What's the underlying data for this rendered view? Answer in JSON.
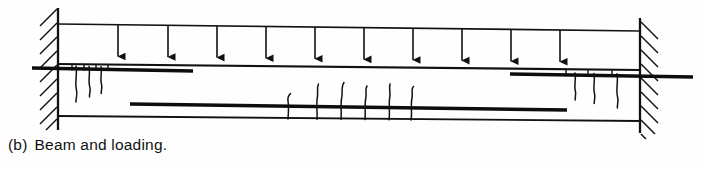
{
  "figure": {
    "caption_label": "(b)",
    "caption_text": "Beam and loading.",
    "type": "structural-beam-diagram",
    "colors": {
      "ink": "#111111",
      "background": "#fefefe",
      "rebar": "#0d0d0d"
    }
  },
  "diagram": {
    "supports": {
      "left": {
        "name": "left-fixed-support",
        "wall_x": 58,
        "hatch_direction": "up-right",
        "hatch_count": 9,
        "top_y": 10,
        "bottom_y": 128
      },
      "right": {
        "name": "right-fixed-support",
        "wall_x": 640,
        "hatch_direction": "down-right",
        "hatch_count": 9,
        "top_y": 20,
        "bottom_y": 130
      }
    },
    "beam": {
      "top_edge": {
        "x1": 58,
        "y1": 64,
        "x2": 640,
        "y2": 70
      },
      "bottom_edge": {
        "x1": 58,
        "y1": 116,
        "x2": 640,
        "y2": 121
      },
      "span_px": 582
    },
    "load": {
      "label": "uniformly distributed load",
      "load_line": {
        "x1": 58,
        "y1": 24,
        "x2": 640,
        "y2": 31
      },
      "arrow_count": 10,
      "arrow_x": [
        118,
        168,
        217,
        266,
        315,
        364,
        413,
        462,
        511,
        560
      ],
      "arrow_tail_y_left": 25,
      "arrow_head_y_left": 63
    },
    "reinforcement": [
      {
        "name": "top-left-rebar",
        "x1": 32,
        "y1": 68,
        "x2": 193,
        "y2": 71,
        "thickness": 3.4
      },
      {
        "name": "top-right-rebar",
        "x1": 510,
        "y1": 74,
        "x2": 693,
        "y2": 77,
        "thickness": 3.4
      },
      {
        "name": "bottom-midspan-rebar",
        "x1": 130,
        "y1": 104,
        "x2": 567,
        "y2": 110,
        "thickness": 3.4
      }
    ],
    "cracks": {
      "negative_moment_left": {
        "name": "left-support-cracks",
        "description": "flexural cracks at left support propagating downward from top face",
        "count": 3,
        "x": [
          76,
          89,
          101
        ],
        "top_y": 66,
        "depth": [
          36,
          31,
          27
        ]
      },
      "negative_moment_right": {
        "name": "right-support-cracks",
        "description": "flexural cracks at right support propagating downward from top face",
        "count": 3,
        "x": [
          575,
          594,
          617
        ],
        "top_y": 73,
        "depth": [
          28,
          31,
          36
        ]
      },
      "positive_moment_mid": {
        "name": "midspan-cracks",
        "description": "flexural cracks at midspan propagating upward from bottom face",
        "count": 6,
        "x": [
          288,
          317,
          341,
          365,
          389,
          411
        ],
        "bottom_y": 119,
        "height": [
          26,
          36,
          38,
          34,
          36,
          33
        ]
      }
    },
    "stirrup_ticks": {
      "left": {
        "name": "left-stirrup-ticks",
        "x": [
          72,
          84,
          96,
          108
        ],
        "y1": 64,
        "y2": 70
      },
      "right": {
        "name": "right-stirrup-ticks",
        "x": [
          566,
          588,
          612
        ],
        "y1": 70,
        "y2": 77
      }
    }
  }
}
